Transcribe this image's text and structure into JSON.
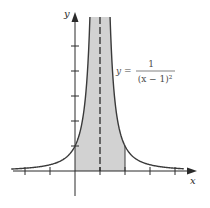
{
  "chart_data": {
    "type": "area",
    "title": "",
    "function": "y = 1/(x - 1)^2",
    "xlabel": "x",
    "ylabel": "y",
    "xlim": [
      -2,
      4
    ],
    "ylim": [
      0,
      6.2
    ],
    "x_ticks": [
      -2,
      -1,
      0,
      1,
      2,
      3,
      4
    ],
    "y_ticks": [
      1,
      2,
      3,
      4,
      5
    ],
    "tick_labels_shown": false,
    "vertical_asymptote": 1,
    "shaded_region": {
      "from_x": 0,
      "to_x": 2,
      "under_curve": true
    },
    "series": [
      {
        "name": "y = 1/(x - 1)^2",
        "x": [
          -2.1,
          -2,
          -1,
          0,
          0.5,
          0.6,
          1.4,
          1.5,
          2,
          3,
          4,
          4.3
        ],
        "values": [
          0.1,
          0.111,
          0.25,
          1,
          4,
          6.25,
          6.25,
          4,
          1,
          0.25,
          0.111,
          0.092
        ]
      }
    ],
    "annotations": [
      {
        "text": "y = 1/(x − 1)²",
        "position": "right of curve near top"
      }
    ],
    "grid": false,
    "legend": "none"
  },
  "labels": {
    "x_axis": "x",
    "y_axis": "y",
    "eq_lhs": "y =",
    "eq_num": "1",
    "eq_den": "(x − 1)²"
  },
  "colors": {
    "curve": "#3a3a3a",
    "shade": "#d2d2d2",
    "axis": "#2a2a2a",
    "dashed": "#2a2a2a"
  },
  "layout": {
    "origin_px": [
      75,
      171
    ],
    "unit_px": 25,
    "top_px": 17
  }
}
